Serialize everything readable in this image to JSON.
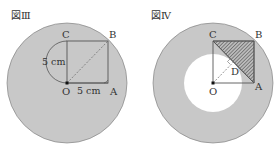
{
  "figures": [
    {
      "title": "図Ⅲ",
      "points": {
        "O": "O",
        "A": "A",
        "B": "B",
        "C": "C"
      },
      "dimensions": {
        "vertical": "5 cm",
        "horizontal": "5 cm"
      }
    },
    {
      "title": "図Ⅳ",
      "points": {
        "O": "O",
        "A": "A",
        "B": "B",
        "C": "C",
        "D": "D"
      }
    }
  ],
  "colors": {
    "disk": "#c8c8c8",
    "stroke": "#555555",
    "hatch": "#666666",
    "background": "#ffffff"
  }
}
